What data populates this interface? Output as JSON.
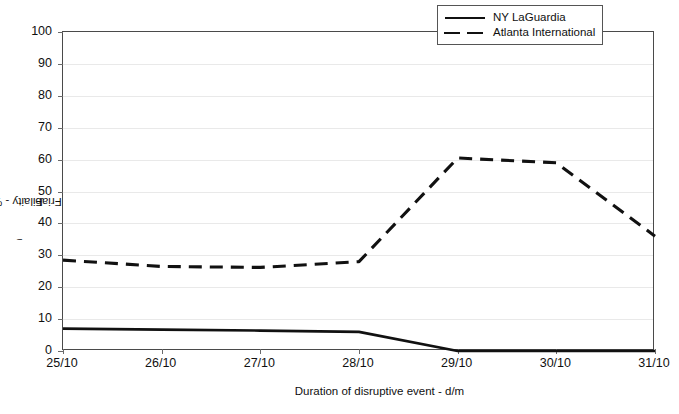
{
  "chart_data": {
    "type": "line",
    "title": "",
    "xlabel": "Duration of disruptive event - d/m",
    "ylabel": "F₁ - Friabilaity - %",
    "categories": [
      "25/10",
      "26/10",
      "27/10",
      "28/10",
      "29/10",
      "30/10",
      "31/10"
    ],
    "ylim": [
      0,
      100
    ],
    "yticks": [
      0,
      10,
      20,
      30,
      40,
      50,
      60,
      70,
      80,
      90,
      100
    ],
    "grid": true,
    "legend_position": "top-right-inside",
    "series": [
      {
        "name": "NY LaGuardia",
        "style": "solid",
        "color": "#111111",
        "values": [
          7.0,
          6.7,
          6.4,
          6.0,
          0.0,
          0.0,
          0.0
        ]
      },
      {
        "name": "Atlanta International",
        "style": "dashed",
        "color": "#111111",
        "values": [
          28.5,
          26.5,
          26.2,
          28.0,
          60.5,
          59.0,
          36.0
        ]
      }
    ]
  },
  "axes": {
    "y_tick_labels": [
      "100",
      "90",
      "80",
      "70",
      "60",
      "50",
      "40",
      "30",
      "20",
      "10",
      "0"
    ],
    "x_tick_labels": [
      "25/10",
      "26/10",
      "27/10",
      "28/10",
      "29/10",
      "30/10",
      "31/10"
    ],
    "y_title_main": "F",
    "y_title_sub": "i",
    "y_title_rest": " - Friabilaity - %",
    "x_title": "Duration of disruptive event - d/m"
  },
  "legend": {
    "items": [
      {
        "label": "NY LaGuardia",
        "style": "solid"
      },
      {
        "label": "Atlanta International",
        "style": "dashed"
      }
    ]
  }
}
